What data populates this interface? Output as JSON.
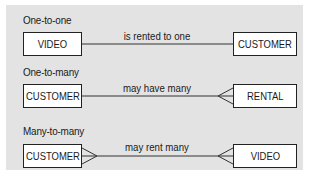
{
  "diagram": {
    "colors": {
      "panel_background": "#e3e3e3",
      "entity_fill": "#ffffff",
      "line": "#333333",
      "text": "#1a1a1a"
    },
    "rows": [
      {
        "type_label": "One-to-one",
        "left_entity": "VIDEO",
        "right_entity": "CUSTOMER",
        "relationship_label": "is rented to one",
        "left_end": "one",
        "right_end": "one"
      },
      {
        "type_label": "One-to-many",
        "left_entity": "CUSTOMER",
        "right_entity": "RENTAL",
        "relationship_label": "may have many",
        "left_end": "one",
        "right_end": "crow-foot"
      },
      {
        "type_label": "Many-to-many",
        "left_entity": "CUSTOMER",
        "right_entity": "VIDEO",
        "relationship_label": "may rent many",
        "left_end": "crow-foot",
        "right_end": "crow-foot"
      }
    ]
  }
}
